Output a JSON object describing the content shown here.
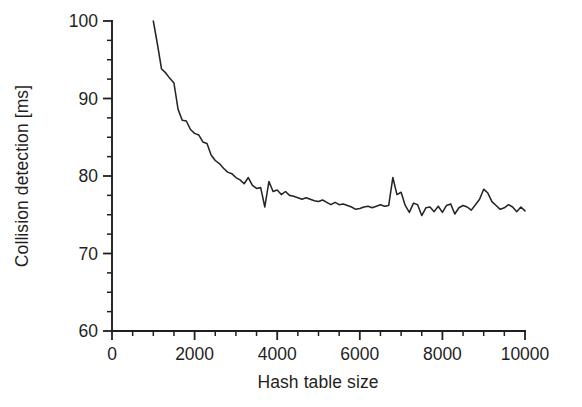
{
  "chart_data": {
    "type": "line",
    "title": "",
    "subtitle": "",
    "xlabel": "Hash table size",
    "ylabel": "Collision detection [ms]",
    "xlim": [
      0,
      10000
    ],
    "ylim": [
      60,
      100
    ],
    "xticks": [
      0,
      2000,
      4000,
      6000,
      8000,
      10000
    ],
    "xtick_labels": [
      "0",
      "2000",
      "4000",
      "6000",
      "8000",
      "10000"
    ],
    "yticks": [
      60,
      70,
      80,
      90,
      100
    ],
    "ytick_labels": [
      "60",
      "70",
      "80",
      "90",
      "100"
    ],
    "x_minor_tick_interval": 500,
    "y_minor_tick_interval": 2.5,
    "grid": false,
    "legend": null,
    "legend_position": "none",
    "line_color": "#252525",
    "series": [
      {
        "name": "Collision detection time",
        "x": [
          1000,
          1100,
          1200,
          1300,
          1400,
          1500,
          1600,
          1700,
          1800,
          1900,
          2000,
          2100,
          2200,
          2300,
          2400,
          2500,
          2600,
          2700,
          2800,
          2900,
          3000,
          3100,
          3200,
          3300,
          3400,
          3500,
          3600,
          3700,
          3800,
          3900,
          4000,
          4100,
          4200,
          4300,
          4400,
          4500,
          4600,
          4700,
          4800,
          4900,
          5000,
          5100,
          5200,
          5300,
          5400,
          5500,
          5600,
          5700,
          5800,
          5900,
          6000,
          6100,
          6200,
          6300,
          6400,
          6500,
          6600,
          6700,
          6800,
          6900,
          7000,
          7100,
          7200,
          7300,
          7400,
          7500,
          7600,
          7700,
          7800,
          7900,
          8000,
          8100,
          8200,
          8300,
          8400,
          8500,
          8600,
          8700,
          8800,
          8900,
          9000,
          9100,
          9200,
          9300,
          9400,
          9500,
          9600,
          9700,
          9800,
          9900,
          10000
        ],
        "y": [
          100.0,
          97.0,
          93.8,
          93.3,
          92.6,
          92.0,
          88.6,
          87.2,
          87.1,
          86.0,
          85.5,
          85.3,
          84.4,
          84.2,
          82.7,
          82.0,
          81.6,
          81.0,
          80.5,
          80.3,
          79.8,
          79.5,
          79.0,
          79.8,
          78.8,
          78.4,
          78.5,
          76.0,
          79.3,
          78.0,
          78.2,
          77.6,
          78.0,
          77.5,
          77.4,
          77.2,
          77.0,
          77.2,
          77.0,
          76.8,
          76.7,
          76.9,
          76.6,
          76.3,
          76.6,
          76.3,
          76.4,
          76.2,
          76.0,
          75.7,
          75.8,
          76.0,
          76.1,
          75.9,
          76.1,
          76.3,
          76.1,
          76.2,
          79.8,
          77.6,
          77.9,
          76.2,
          75.3,
          76.5,
          76.3,
          74.9,
          75.9,
          76.0,
          75.4,
          76.1,
          75.3,
          76.2,
          76.4,
          75.1,
          75.9,
          76.2,
          76.0,
          75.6,
          76.3,
          77.0,
          78.3,
          77.8,
          76.7,
          76.2,
          75.7,
          75.9,
          76.3,
          76.0,
          75.4,
          76.0,
          75.5
        ]
      }
    ]
  }
}
